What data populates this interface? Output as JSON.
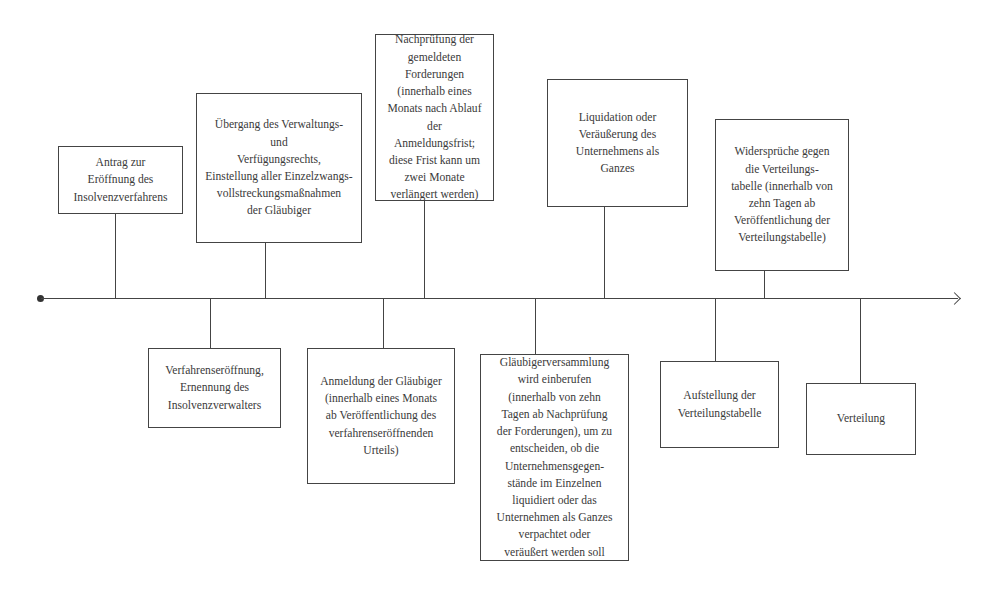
{
  "diagram": {
    "type": "timeline",
    "axis": {
      "start_marker": "dot",
      "end_marker": "arrow"
    },
    "above": [
      {
        "id": "a",
        "text": "Antrag zur\nEröffnung des\nInsolvenzverfahrens"
      },
      {
        "id": "b",
        "text": "Übergang des Verwaltungs-\nund\nVerfügungsrechts,\nEinstellung aller Einzelzwangs-\nvollstreckungsmaßnahmen\nder Gläubiger"
      },
      {
        "id": "c",
        "text": "Nachprüfung der\ngemeldeten\nForderungen\n(innerhalb eines\nMonats nach Ablauf\nder\nAnmeldungsfrist;\ndiese Frist kann um\nzwei Monate\nverlängert werden)"
      },
      {
        "id": "d",
        "text": "Liquidation oder\nVeräußerung des\nUnternehmens als\nGanzes"
      },
      {
        "id": "e",
        "text": "Widersprüche gegen\ndie Verteilungs-\ntabelle (innerhalb von\nzehn Tagen ab\nVeröffentlichung der\nVerteilungstabelle)"
      }
    ],
    "below": [
      {
        "id": "f",
        "text": "Verfahrenseröffnung,\nErnennung des\nInsolvenzverwalters"
      },
      {
        "id": "g",
        "text": "Anmeldung der Gläubiger\n(innerhalb eines Monats\nab Veröffentlichung des\nverfahrenseröffnenden\nUrteils)"
      },
      {
        "id": "h",
        "text": "Gläubigerversammlung\nwird einberufen\n(innerhalb von zehn\nTagen ab Nachprüfung\nder Forderungen), um zu\nentscheiden, ob die\nUnternehmensgegen-\nstände im Einzelnen\nliquidiert oder das\nUnternehmen als Ganzes\nverpachtet oder\nveräußert werden soll"
      },
      {
        "id": "i",
        "text": "Aufstellung der\nVerteilungstabelle"
      },
      {
        "id": "j",
        "text": "Verteilung"
      }
    ]
  }
}
